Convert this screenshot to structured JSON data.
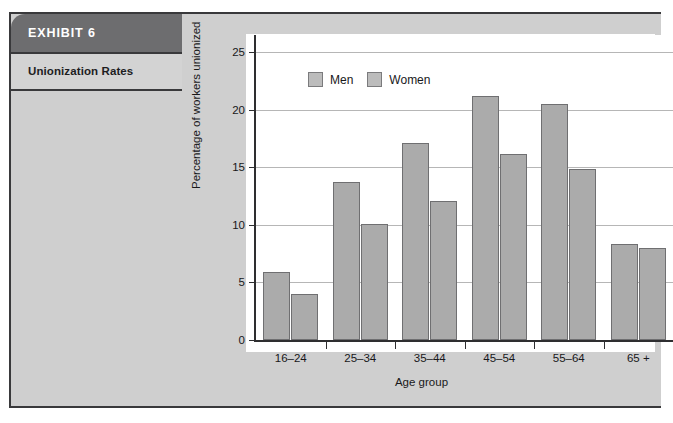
{
  "exhibit": {
    "number_label": "EXHIBIT 6",
    "title": "Unionization Rates"
  },
  "colors": {
    "header_band": "#6d6d6f",
    "title_band": "#d3d3d3",
    "panel_background": "#cfcfcf",
    "frame_border": "#39393b",
    "bar_fill": "#ababab",
    "bar_border": "#6f6f71",
    "gridline": "#b6b6b6",
    "axis": "#2e2e30",
    "plot_background": "#ffffff",
    "header_text": "#ffffff",
    "body_text": "#1d1d1f"
  },
  "chart_data": {
    "type": "bar",
    "title": "",
    "subtitle": "",
    "xlabel": "Age group",
    "ylabel": "Percentage of workers unionized",
    "categories": [
      "16–24",
      "25–34",
      "35–44",
      "45–54",
      "55–64",
      "65 +"
    ],
    "series": [
      {
        "name": "Men",
        "values": [
          5.9,
          13.7,
          17.1,
          21.2,
          20.5,
          8.3
        ]
      },
      {
        "name": "Women",
        "values": [
          4.0,
          10.1,
          12.1,
          16.2,
          14.9,
          8.0
        ]
      }
    ],
    "ylim": [
      0,
      26.5
    ],
    "yticks": [
      0,
      5,
      10,
      15,
      20,
      25
    ],
    "ytick_labels": [
      "0",
      "5",
      "10",
      "15",
      "20",
      "25"
    ],
    "grid": "horizontal",
    "legend_position": "top-left-inside",
    "legend": [
      "Men",
      "Women"
    ]
  }
}
